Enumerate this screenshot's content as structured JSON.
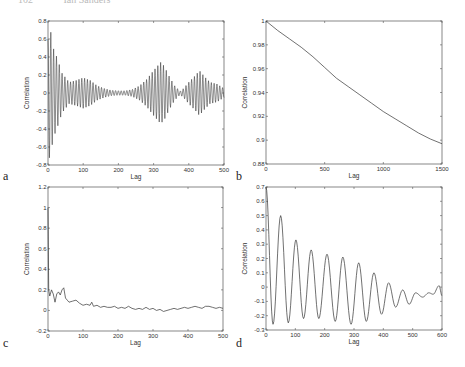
{
  "header": {
    "page_number": "102",
    "running_title": "Ian Sanders"
  },
  "chart_data": [
    {
      "panel": "a",
      "type": "line",
      "title": "",
      "xlabel": "Lag",
      "ylabel": "Correlation",
      "xlim": [
        0,
        500
      ],
      "ylim": [
        -0.8,
        0.8
      ],
      "xticks": [
        0,
        100,
        200,
        300,
        400,
        500
      ],
      "yticks": [
        -0.8,
        -0.6,
        -0.4,
        -0.2,
        0,
        0.2,
        0.4,
        0.6,
        0.8
      ],
      "ytick_labels": [
        "-0.8",
        "-0.6",
        "-0.4",
        "-0.2",
        "0",
        "0.2",
        "0.4",
        "0.6",
        "0.8"
      ],
      "grid": false,
      "description": "Rapid oscillation (period ~8 lags) with amplitude envelope",
      "envelope": {
        "x": [
          0,
          5,
          15,
          25,
          40,
          60,
          80,
          100,
          120,
          140,
          160,
          180,
          200,
          220,
          240,
          260,
          280,
          300,
          320,
          330,
          345,
          360,
          375,
          385,
          400,
          420,
          430,
          445,
          460,
          480,
          500
        ],
        "amplitude": [
          0.6,
          0.75,
          0.5,
          0.4,
          0.22,
          0.12,
          0.14,
          0.17,
          0.14,
          0.08,
          0.05,
          0.03,
          0.025,
          0.025,
          0.04,
          0.08,
          0.15,
          0.25,
          0.34,
          0.3,
          0.18,
          0.08,
          0.02,
          0.05,
          0.12,
          0.2,
          0.25,
          0.18,
          0.12,
          0.1,
          0.05
        ]
      },
      "oscillation_period": 8
    },
    {
      "panel": "b",
      "type": "line",
      "title": "",
      "xlabel": "Lag",
      "ylabel": "Correlation",
      "xlim": [
        0,
        1500
      ],
      "ylim": [
        0.88,
        1.0
      ],
      "xticks": [
        0,
        500,
        1000,
        1500
      ],
      "yticks": [
        0.88,
        0.9,
        0.92,
        0.94,
        0.96,
        0.98,
        1
      ],
      "ytick_labels": [
        "0.88",
        "0.9",
        "0.92",
        "0.94",
        "0.96",
        "0.98",
        "1"
      ],
      "grid": false,
      "x": [
        0,
        100,
        200,
        300,
        400,
        500,
        600,
        700,
        800,
        900,
        1000,
        1100,
        1200,
        1300,
        1400,
        1500
      ],
      "values": [
        1.0,
        0.992,
        0.985,
        0.978,
        0.97,
        0.961,
        0.952,
        0.945,
        0.938,
        0.931,
        0.924,
        0.918,
        0.912,
        0.906,
        0.901,
        0.897
      ]
    },
    {
      "panel": "c",
      "type": "line",
      "title": "",
      "xlabel": "Lag",
      "ylabel": "Correlation",
      "xlim": [
        0,
        500
      ],
      "ylim": [
        -0.2,
        1.2
      ],
      "xticks": [
        0,
        100,
        200,
        300,
        400,
        500
      ],
      "yticks": [
        -0.2,
        0,
        0.2,
        0.4,
        0.6,
        0.8,
        1,
        1.2
      ],
      "ytick_labels": [
        "-0.2",
        "0",
        "0.2",
        "0.4",
        "0.6",
        "0.8",
        "1",
        "1.2"
      ],
      "grid": false,
      "x": [
        0,
        2,
        5,
        10,
        15,
        20,
        25,
        30,
        35,
        40,
        45,
        50,
        55,
        60,
        70,
        80,
        90,
        100,
        110,
        120,
        125,
        130,
        140,
        150,
        160,
        170,
        180,
        190,
        200,
        210,
        220,
        230,
        240,
        250,
        260,
        270,
        280,
        290,
        300,
        310,
        320,
        330,
        340,
        350,
        360,
        370,
        380,
        390,
        400,
        410,
        420,
        430,
        440,
        450,
        460,
        470,
        480,
        490,
        500
      ],
      "values": [
        1.0,
        0.2,
        0.14,
        0.2,
        0.16,
        0.08,
        0.16,
        0.18,
        0.15,
        0.2,
        0.22,
        0.12,
        0.1,
        0.08,
        0.09,
        0.1,
        0.07,
        0.05,
        0.06,
        0.05,
        0.08,
        0.04,
        0.05,
        0.03,
        0.04,
        0.03,
        0.03,
        0.04,
        0.02,
        0.03,
        0.02,
        0.04,
        0.02,
        0.01,
        0.02,
        0.01,
        0.03,
        0.01,
        0.02,
        0.0,
        0.01,
        -0.01,
        0.0,
        0.01,
        0.02,
        0.01,
        0.02,
        0.03,
        0.02,
        0.03,
        0.04,
        0.03,
        0.02,
        0.04,
        0.04,
        0.03,
        0.02,
        0.03,
        0.02
      ]
    },
    {
      "panel": "d",
      "type": "line",
      "title": "",
      "xlabel": "Lag",
      "ylabel": "Correlation",
      "xlim": [
        0,
        600
      ],
      "ylim": [
        -0.3,
        0.7
      ],
      "xticks": [
        0,
        100,
        200,
        300,
        400,
        500,
        600
      ],
      "yticks": [
        -0.3,
        -0.2,
        -0.1,
        0,
        0.1,
        0.2,
        0.3,
        0.4,
        0.5,
        0.6,
        0.7
      ],
      "ytick_labels": [
        "-0.3",
        "-0.2",
        "-0.1",
        "0",
        "0.1",
        "0.2",
        "0.3",
        "0.4",
        "0.5",
        "0.6",
        "0.7"
      ],
      "grid": false,
      "x": [
        0,
        24,
        50,
        76,
        102,
        128,
        154,
        180,
        208,
        236,
        262,
        290,
        316,
        342,
        368,
        394,
        418,
        442,
        466,
        488,
        510,
        534,
        555,
        570,
        590,
        600
      ],
      "values": [
        0.7,
        -0.26,
        0.5,
        -0.25,
        0.33,
        -0.22,
        0.26,
        -0.22,
        0.23,
        -0.24,
        0.21,
        -0.26,
        0.17,
        -0.24,
        0.1,
        -0.19,
        0.03,
        -0.14,
        -0.02,
        -0.12,
        -0.04,
        -0.07,
        -0.04,
        -0.05,
        0.01,
        -0.06
      ]
    }
  ],
  "panels": {
    "a": {
      "letter": "a",
      "xlabel": "Lag",
      "ylabel": "Correlation"
    },
    "b": {
      "letter": "b",
      "xlabel": "Lag",
      "ylabel": "Correlation"
    },
    "c": {
      "letter": "c",
      "xlabel": "Lag",
      "ylabel": "Correlation"
    },
    "d": {
      "letter": "d",
      "xlabel": "Lag",
      "ylabel": "Correlation"
    }
  },
  "style": {
    "line_color": "#333333",
    "axis_color": "#555555",
    "background": "#ffffff"
  }
}
